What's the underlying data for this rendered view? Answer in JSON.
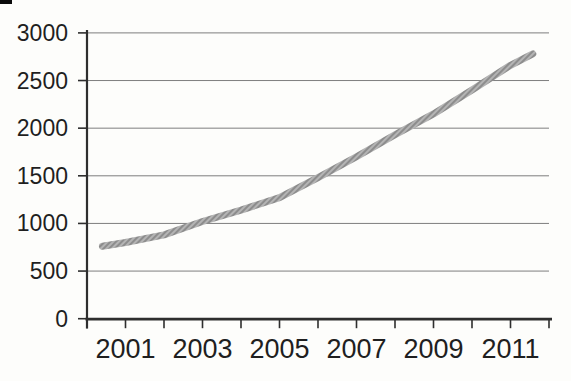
{
  "figure": {
    "background": "#fdfdfb",
    "artifact_color": "#0a0a0a"
  },
  "chart_data": {
    "type": "line",
    "title": "",
    "xlabel": "",
    "ylabel": "",
    "x_range": [
      2000,
      2012
    ],
    "y_range": [
      0,
      3000
    ],
    "grid": true,
    "legend": "none",
    "x_minor_tick_years": [
      2000,
      2001,
      2002,
      2003,
      2004,
      2005,
      2006,
      2007,
      2008,
      2009,
      2010,
      2011,
      2012
    ],
    "x_tick_labels": [
      {
        "year": 2001,
        "label": "2001"
      },
      {
        "year": 2003,
        "label": "2003"
      },
      {
        "year": 2005,
        "label": "2005"
      },
      {
        "year": 2007,
        "label": "2007"
      },
      {
        "year": 2009,
        "label": "2009"
      },
      {
        "year": 2011,
        "label": "2011"
      }
    ],
    "y_ticks": [
      {
        "value": 0,
        "label": "0"
      },
      {
        "value": 500,
        "label": "500"
      },
      {
        "value": 1000,
        "label": "1000"
      },
      {
        "value": 1500,
        "label": "1500"
      },
      {
        "value": 2000,
        "label": "2000"
      },
      {
        "value": 2500,
        "label": "2500"
      },
      {
        "value": 3000,
        "label": "3000"
      }
    ],
    "series": [
      {
        "name": "trend-line",
        "x": [
          2000.4,
          2001,
          2002,
          2003,
          2004,
          2005,
          2006,
          2007,
          2008,
          2009,
          2010,
          2011,
          2011.58
        ],
        "y": [
          760,
          800,
          880,
          1020,
          1140,
          1270,
          1480,
          1700,
          1930,
          2150,
          2400,
          2660,
          2780
        ],
        "line_width": 7,
        "texture": "diagonal-halftone",
        "color_light": "#b4b4b4",
        "color_dark": "#8d8d8d"
      }
    ],
    "colors": {
      "grid": "#7e7e7e",
      "axis": "#2e2e2e",
      "tick": "#2e2e2e",
      "label_text": "#1f1f1f"
    }
  }
}
